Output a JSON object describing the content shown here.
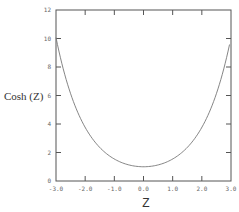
{
  "chart_data": {
    "type": "line",
    "title": "",
    "xlabel": "Z",
    "ylabel": "Cosh (Z)",
    "xlim": [
      -3.0,
      3.0
    ],
    "ylim": [
      0,
      12
    ],
    "x_ticks": [
      "-3.0",
      "-2.0",
      "-1.0",
      "0.0",
      "1.0",
      "2.0",
      "3.0"
    ],
    "y_ticks": [
      "0",
      "2",
      "4",
      "6",
      "8",
      "10",
      "12"
    ],
    "grid": false,
    "legend": null,
    "series": [
      {
        "name": "Cosh (Z)",
        "x": [
          -3.0,
          -2.5,
          -2.0,
          -1.5,
          -1.0,
          -0.5,
          0.0,
          0.5,
          1.0,
          1.5,
          2.0,
          2.5,
          2.95
        ],
        "values": [
          10.07,
          6.13,
          3.76,
          2.35,
          1.54,
          1.13,
          1.0,
          1.13,
          1.54,
          2.35,
          3.76,
          6.13,
          9.58
        ]
      }
    ]
  }
}
